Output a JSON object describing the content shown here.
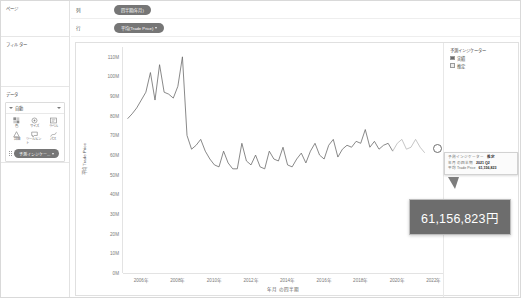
{
  "sidebar": {
    "panes": [
      {
        "name": "pages",
        "title": "ページ"
      },
      {
        "name": "filters",
        "title": "フィルター"
      },
      {
        "name": "data",
        "title": "データ"
      }
    ],
    "marks_card": {
      "type_label": "自動",
      "buttons": [
        {
          "icon": "color-icon",
          "label": "色"
        },
        {
          "icon": "size-icon",
          "label": "サイズ"
        },
        {
          "icon": "label-icon",
          "label": "ラベル"
        },
        {
          "icon": "detail-icon",
          "label": "詳細"
        },
        {
          "icon": "tooltip-icon",
          "label": "ツールヒント"
        },
        {
          "icon": "path-icon",
          "label": "パス"
        }
      ],
      "pill": "予測インジケー..."
    }
  },
  "shelves": [
    {
      "label": "列",
      "pill": "四半期(年月)"
    },
    {
      "label": "行",
      "pill": "平均(Trade Price)"
    }
  ],
  "legend": {
    "title": "予測インジケーター",
    "items": [
      {
        "label": "実績",
        "color": "#6b6b6b"
      },
      {
        "label": "推定",
        "color": "#e8e8e8"
      }
    ]
  },
  "tooltip_detail": {
    "rows": [
      {
        "key": "予測インジケーター",
        "value": "推定"
      },
      {
        "key": "年月 の四半期",
        "value": "2021 Q2"
      },
      {
        "key": "平均 Trade Price",
        "value": "61,156,823"
      }
    ]
  },
  "tooltip_big": {
    "value": "61,156,823円"
  },
  "chart_data": {
    "type": "line",
    "title": "",
    "xlabel": "年月 の四半期",
    "ylabel": "平均 Trade Price",
    "ylim": [
      0,
      115000000
    ],
    "ytick_labels": [
      "110M",
      "100M",
      "90M",
      "80M",
      "70M",
      "60M",
      "50M",
      "40M",
      "30M",
      "20M",
      "10M",
      "0M"
    ],
    "ytick_values": [
      110000000,
      100000000,
      90000000,
      80000000,
      70000000,
      60000000,
      50000000,
      40000000,
      30000000,
      20000000,
      10000000,
      0
    ],
    "xtick_labels": [
      "2006年",
      "2008年",
      "2010年",
      "2012年",
      "2014年",
      "2016年",
      "2018年",
      "2020年",
      "2022年"
    ],
    "xtick_values": [
      2006,
      2008,
      2010,
      2012,
      2014,
      2016,
      2018,
      2020,
      2022
    ],
    "xlim": [
      2005.0,
      2022.5
    ],
    "grid": false,
    "legend_position": "right",
    "series": [
      {
        "name": "実績",
        "color": "#6b6b6b",
        "x": [
          2005.25,
          2005.5,
          2005.75,
          2006.0,
          2006.25,
          2006.5,
          2006.75,
          2007.0,
          2007.25,
          2007.5,
          2007.75,
          2008.0,
          2008.25,
          2008.5,
          2008.75,
          2009.0,
          2009.25,
          2009.5,
          2009.75,
          2010.0,
          2010.25,
          2010.5,
          2010.75,
          2011.0,
          2011.25,
          2011.5,
          2011.75,
          2012.0,
          2012.25,
          2012.5,
          2012.75,
          2013.0,
          2013.25,
          2013.5,
          2013.75,
          2014.0,
          2014.25,
          2014.5,
          2014.75,
          2015.0,
          2015.25,
          2015.5,
          2015.75,
          2016.0,
          2016.25,
          2016.5,
          2016.75,
          2017.0,
          2017.25,
          2017.5,
          2017.75,
          2018.0,
          2018.25,
          2018.5,
          2018.75,
          2019.0,
          2019.25,
          2019.5,
          2019.75
        ],
        "y": [
          78500000,
          81000000,
          84000000,
          88000000,
          92000000,
          102000000,
          88000000,
          106000000,
          92000000,
          91000000,
          89000000,
          95000000,
          110000000,
          70000000,
          63000000,
          65000000,
          68000000,
          62000000,
          58000000,
          55000000,
          54000000,
          62000000,
          56000000,
          53000000,
          53000000,
          66000000,
          57000000,
          55000000,
          60000000,
          54000000,
          53000000,
          62000000,
          58000000,
          57000000,
          64000000,
          55000000,
          54000000,
          58000000,
          61000000,
          56000000,
          62000000,
          66000000,
          60000000,
          58000000,
          65000000,
          68000000,
          59000000,
          63000000,
          65000000,
          64000000,
          67000000,
          66000000,
          73000000,
          64000000,
          67000000,
          63000000,
          65000000,
          66000000,
          62000000
        ]
      },
      {
        "name": "推定",
        "color": "#b8b8b8",
        "x": [
          2019.75,
          2020.0,
          2020.25,
          2020.5,
          2020.75,
          2021.0,
          2021.25,
          2021.5
        ],
        "y": [
          62000000,
          66000000,
          68000000,
          63000000,
          64000000,
          68000000,
          64000000,
          61156823
        ]
      }
    ],
    "highlight_point": {
      "x": 2021.5,
      "y": 61156823,
      "label": "61,156,823円"
    }
  }
}
